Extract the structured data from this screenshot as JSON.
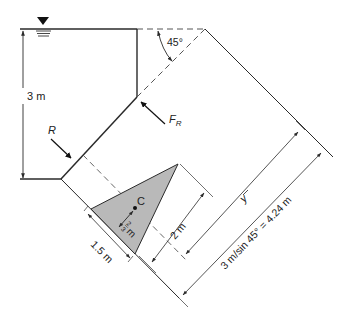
{
  "diagram": {
    "colors": {
      "line": "#2a2a2a",
      "triangle_fill": "#b9b9b9",
      "dash": "#555555",
      "background": "#ffffff"
    },
    "labels": {
      "depth": "3 m",
      "angle": "45°",
      "resultant_force": "F",
      "resultant_force_sub": "R",
      "reaction": "R",
      "centroid": "C",
      "centroid_offset_num": "2",
      "centroid_offset_den": "3",
      "centroid_offset_unit": "m",
      "base_width": "1.5 m",
      "triangle_height": "2 m",
      "ybar": "y",
      "slant_length": "3 m/sin 45° = 4.24 m"
    },
    "symbols": {
      "free_surface": "inverted-triangle-water-level-icon"
    }
  }
}
